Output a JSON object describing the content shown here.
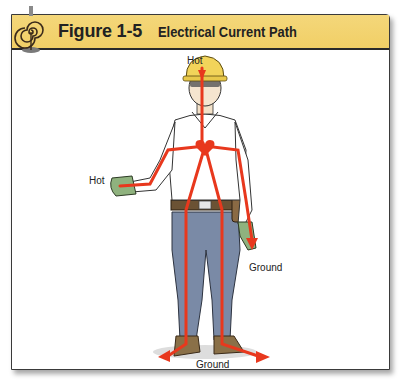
{
  "figure": {
    "number": "Figure 1-5",
    "title": "Electrical Current Path",
    "header_color": "#f3d36f",
    "path_color": "#e8381d"
  },
  "labels": {
    "head": "Hot",
    "hand": "Hot",
    "left_hand_ground": "Ground",
    "feet_ground": "Ground"
  },
  "illustration": {
    "subject": "Worker in hard hat, safety glasses, gloves and tool belt",
    "current_path": [
      "head",
      "right hand",
      "chest/heart",
      "left hand",
      "both feet"
    ]
  }
}
